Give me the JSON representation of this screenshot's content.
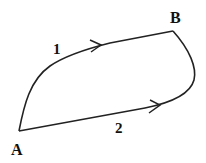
{
  "diagram": {
    "points": {
      "A": {
        "label": "A",
        "x": 19,
        "y": 131
      },
      "B": {
        "label": "B",
        "x": 173,
        "y": 31
      }
    },
    "paths": [
      {
        "id": "1",
        "label": "1",
        "from": "A",
        "to": "B",
        "description": "upper curved path from A to B"
      },
      {
        "id": "2",
        "label": "2",
        "from": "A",
        "to": "B",
        "description": "lower path from A to B curving up at the right"
      }
    ],
    "colors": {
      "stroke": "#222222",
      "text": "#111111",
      "background": "#ffffff"
    }
  }
}
